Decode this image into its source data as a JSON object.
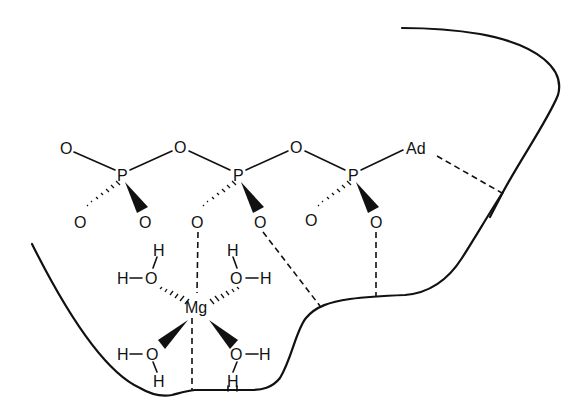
{
  "diagram": {
    "type": "chemical-structure",
    "colors": {
      "ink": "#111111",
      "background": "#ffffff"
    },
    "phosphates": [
      {
        "id": "Pgamma",
        "label": "P",
        "x": 122,
        "y": 175
      },
      {
        "id": "Pbeta",
        "label": "P",
        "x": 238,
        "y": 175
      },
      {
        "id": "Palpha",
        "label": "P",
        "x": 353,
        "y": 175
      }
    ],
    "atoms": {
      "o_terminal_top": {
        "label": "O",
        "x": 66,
        "y": 148
      },
      "o_bridge_1": {
        "label": "O",
        "x": 180,
        "y": 147
      },
      "o_bridge_2": {
        "label": "O",
        "x": 296,
        "y": 147
      },
      "adenosine": {
        "label": "Ad",
        "x": 418,
        "y": 148
      },
      "o_g_hash": {
        "label": "O",
        "x": 80,
        "y": 222
      },
      "o_g_wedge": {
        "label": "O",
        "x": 145,
        "y": 222
      },
      "o_b_hash": {
        "label": "O",
        "x": 197,
        "y": 222
      },
      "o_b_wedge": {
        "label": "O",
        "x": 260,
        "y": 222
      },
      "o_a_hash": {
        "label": "O",
        "x": 311,
        "y": 220
      },
      "o_a_wedge": {
        "label": "O",
        "x": 376,
        "y": 222
      },
      "metal": {
        "label": "Mg",
        "x": 197,
        "y": 307
      }
    },
    "waters": [
      {
        "id": "w1",
        "o": "O",
        "h1": "H",
        "h2": "H",
        "position": "upper-left"
      },
      {
        "id": "w2",
        "o": "O",
        "h1": "H",
        "h2": "H",
        "position": "upper-right"
      },
      {
        "id": "w3",
        "o": "O",
        "h1": "H",
        "h2": "H",
        "position": "lower-left"
      },
      {
        "id": "w4",
        "o": "O",
        "h1": "H",
        "h2": "H",
        "position": "lower-right"
      }
    ],
    "labels": {
      "O": "O",
      "P": "P",
      "H": "H",
      "Mg": "Mg",
      "Ad": "Ad"
    },
    "interactions": [
      "dashed: beta-phosphate O to Mg",
      "dashed: Mg to protein surface",
      "dashed: beta-phosphate O to protein surface",
      "dashed: alpha-phosphate O to protein surface",
      "dashed: Ad to protein surface",
      "dashed: lower-right water H to protein surface"
    ]
  }
}
